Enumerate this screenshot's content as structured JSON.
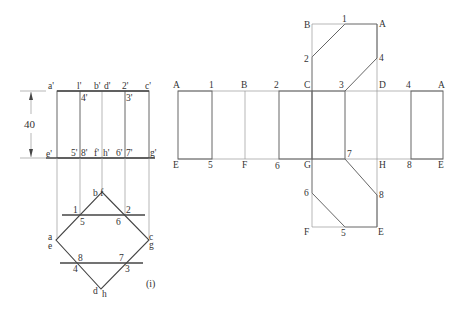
{
  "figure_caption": "(i)",
  "dimension": {
    "value": "40"
  },
  "elevation": {
    "top_labels": [
      "a'",
      "l'",
      "b'",
      "d'",
      "2'",
      "c'"
    ],
    "inner_top_labels": [
      "4'",
      "3'"
    ],
    "bottom_labels": [
      "e'",
      "5'",
      "8'",
      "f'",
      "h'",
      "6'",
      "7'",
      "g'"
    ]
  },
  "plan": {
    "apex_label": "b f",
    "left_label_top": "a",
    "left_label_bottom": "e",
    "right_label_top": "c",
    "right_label_bottom": "g",
    "bottom_label_d": "d",
    "bottom_label_h": "h",
    "upper_cut_labels": [
      "1",
      "2",
      "5",
      "6"
    ],
    "lower_cut_labels": [
      "8",
      "7",
      "4",
      "3"
    ]
  },
  "development": {
    "top_labels": [
      "A",
      "1",
      "B",
      "2",
      "C",
      "3",
      "D",
      "4",
      "A"
    ],
    "bottom_labels": [
      "E",
      "5",
      "F",
      "6",
      "G",
      "7",
      "H",
      "8",
      "E"
    ],
    "top_flap_labels": {
      "B": "B",
      "one": "1",
      "A": "A",
      "two": "2",
      "four": "4"
    },
    "bottom_flap_labels": {
      "six": "6",
      "eight": "8",
      "F": "F",
      "five": "5",
      "E": "E"
    }
  }
}
